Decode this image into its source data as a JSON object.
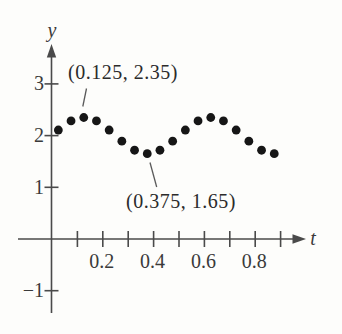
{
  "figure": {
    "background_color": "#fdfdfb",
    "axis_color": "#4a4a4a",
    "text_color": "#3a3a3a",
    "dot_color": "#161616"
  },
  "chart_data": {
    "type": "scatter",
    "title": "",
    "xlabel": "t",
    "ylabel": "y",
    "x": [
      0.025,
      0.075,
      0.125,
      0.175,
      0.225,
      0.275,
      0.325,
      0.375,
      0.425,
      0.475,
      0.525,
      0.575,
      0.625,
      0.675,
      0.725,
      0.775,
      0.825,
      0.875
    ],
    "y": [
      2.108,
      2.283,
      2.35,
      2.283,
      2.108,
      1.892,
      1.717,
      1.65,
      1.717,
      1.892,
      2.108,
      2.283,
      2.35,
      2.283,
      2.108,
      1.892,
      1.717,
      1.65
    ],
    "x_ticks": [
      0.1,
      0.2,
      0.3,
      0.4,
      0.5,
      0.6,
      0.7,
      0.8,
      0.9
    ],
    "x_labeled_ticks": [
      {
        "value": 0.2,
        "label": "0.2"
      },
      {
        "value": 0.4,
        "label": "0.4"
      },
      {
        "value": 0.6,
        "label": "0.6"
      },
      {
        "value": 0.8,
        "label": "0.8"
      }
    ],
    "y_labeled_ticks": [
      {
        "value": 3,
        "label": "3"
      },
      {
        "value": 2,
        "label": "2"
      },
      {
        "value": 1,
        "label": "1"
      },
      {
        "value": -1,
        "label": "−1"
      }
    ],
    "xlim": [
      -0.14,
      1.14
    ],
    "ylim": [
      -1.85,
      4.6
    ],
    "grid": false,
    "legend": false,
    "marker": {
      "shape": "circle",
      "color": "#161616",
      "radius_px": 4.4
    },
    "annotations": [
      {
        "text": "(0.125, 2.35)",
        "target_point": [
          0.125,
          2.35
        ],
        "position": "above-left-of-first-peak"
      },
      {
        "text": "(0.375, 1.65)",
        "target_point": [
          0.375,
          1.65
        ],
        "position": "below-first-trough"
      }
    ]
  }
}
